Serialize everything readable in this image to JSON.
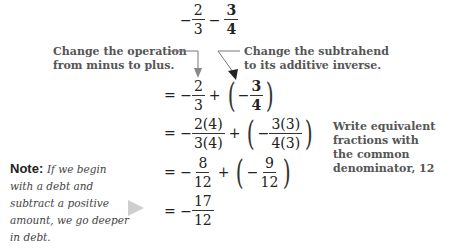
{
  "expression": {
    "first": {
      "sign": "−",
      "num": "2",
      "den": "3"
    },
    "operator": "−",
    "second": {
      "num": "3",
      "den": "4"
    }
  },
  "annotations": {
    "left": [
      "Change the operation",
      "from minus to plus."
    ],
    "right": [
      "Change the subtrahend",
      "to its additive inverse."
    ],
    "equiv": [
      "Write equivalent fractions with",
      "the common denominator, 12"
    ]
  },
  "steps": [
    {
      "eq": "=",
      "a_num": "2",
      "a_den": "3",
      "op": "+",
      "b_num": "3",
      "b_den": "4"
    },
    {
      "eq": "=",
      "a_num": "2(4)",
      "a_den": "3(4)",
      "op": "+",
      "b_num": "3(3)",
      "b_den": "4(3)"
    },
    {
      "eq": "=",
      "a_num": "8",
      "a_den": "12",
      "op": "+",
      "b_num": "9",
      "b_den": "12"
    },
    {
      "eq": "=",
      "a_num": "17",
      "a_den": "12"
    }
  ],
  "note": {
    "label": "Note:",
    "text": "If we begin with a debt and subtract a positive amount, we go deeper in debt."
  },
  "colors": {
    "annotation": "#555555",
    "arrow": "#777777",
    "pointer": "#cfcfcf"
  }
}
